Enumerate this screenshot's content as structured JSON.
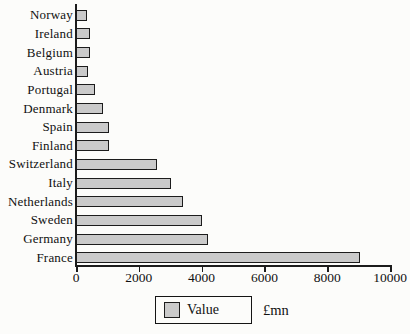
{
  "chart_data": {
    "type": "bar",
    "orientation": "horizontal",
    "title": "",
    "xlabel": "",
    "ylabel": "",
    "categories": [
      "Norway",
      "Ireland",
      "Belgium",
      "Austria",
      "Portugal",
      "Denmark",
      "Spain",
      "Finland",
      "Switzerland",
      "Italy",
      "Netherlands",
      "Sweden",
      "Germany",
      "France"
    ],
    "values": [
      340,
      430,
      455,
      390,
      610,
      870,
      1040,
      1060,
      2580,
      3030,
      3400,
      4010,
      4210,
      9050
    ],
    "xlim": [
      0,
      10000
    ],
    "x_ticks": [
      "0",
      "2000",
      "4000",
      "6000",
      "8000",
      "10000"
    ],
    "grid": false,
    "legend": {
      "position": "bottom",
      "label": "Value",
      "unit": "£mn"
    },
    "colors": {
      "bar_fill": "#cacaca",
      "bar_border": "#1c1c1c",
      "axis": "#1c1c1c",
      "text": "#111111",
      "background": "#fcfcfa"
    }
  }
}
